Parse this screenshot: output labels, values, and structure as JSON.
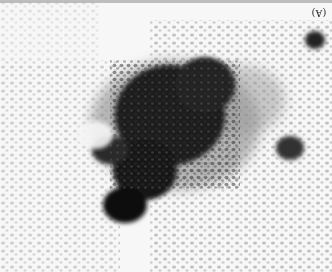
{
  "figure": {
    "panel_label": "(A)",
    "colors": {
      "background": "#f7f7f7",
      "cluster_core": "#111111",
      "cluster_mid": "#444444",
      "scattered_cells": "#9a9a9a",
      "light_cells": "#c4c4c4"
    }
  }
}
